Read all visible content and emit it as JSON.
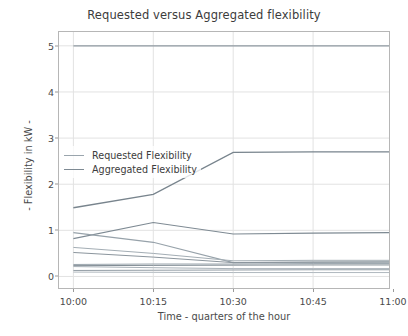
{
  "chart_data": {
    "type": "line",
    "title": "Requested versus Aggregated flexibility",
    "xlabel": "Time - quarters of the hour",
    "ylabel": "- Flexibility in kW -",
    "x": [
      "10:00",
      "10:15",
      "10:30",
      "10:45",
      "11:00"
    ],
    "x_tick_labels": [
      "10:00",
      "10:15",
      "10:30",
      "10:45",
      "11:00"
    ],
    "y_tick_labels": [
      "0",
      "1",
      "2",
      "3",
      "4",
      "5"
    ],
    "y_ticks": [
      0,
      1,
      2,
      3,
      4,
      5
    ],
    "ylim": [
      -0.25,
      5.3
    ],
    "xlim": [
      -0.18,
      3.95
    ],
    "grid": true,
    "legend_position": "center-left",
    "colors": {
      "requested": "#9aa5ad",
      "aggregated": "#7e8a93",
      "grid": "#e2e2e2",
      "axis": "#b6b6b6",
      "text": "#4a4a4a"
    },
    "legend": [
      {
        "label": "Requested Flexibility",
        "color": "#9aa5ad"
      },
      {
        "label": "Aggregated Flexibility",
        "color": "#7e8a93"
      }
    ],
    "series": [
      {
        "name": "Requested Flexibility - cap",
        "group": "requested",
        "color": "#8f9aa2",
        "width": 1.1,
        "values": [
          5.0,
          5.0,
          5.0,
          5.0,
          5.0
        ]
      },
      {
        "name": "Aggregated Flexibility - total",
        "group": "aggregated",
        "color": "#78848d",
        "width": 1.3,
        "values": [
          1.49,
          1.78,
          2.69,
          2.7,
          2.7
        ]
      },
      {
        "name": "Aggregated Flexibility - b",
        "group": "aggregated",
        "color": "#7e8a93",
        "width": 1.1,
        "values": [
          0.82,
          1.17,
          0.92,
          0.94,
          0.95
        ]
      },
      {
        "name": "Requested Flexibility - c",
        "group": "requested",
        "color": "#97a2aa",
        "width": 1.1,
        "values": [
          0.95,
          0.74,
          0.3,
          0.31,
          0.32
        ]
      },
      {
        "name": "Requested Flexibility - d",
        "group": "requested",
        "color": "#a3adb4",
        "width": 1.0,
        "values": [
          0.63,
          0.5,
          0.34,
          0.35,
          0.35
        ]
      },
      {
        "name": "Aggregated Flexibility - e",
        "group": "aggregated",
        "color": "#8b959d",
        "width": 1.0,
        "values": [
          0.52,
          0.42,
          0.3,
          0.31,
          0.31
        ]
      },
      {
        "name": "Requested Flexibility - f",
        "group": "requested",
        "color": "#9aa5ad",
        "width": 1.0,
        "values": [
          0.26,
          0.27,
          0.27,
          0.28,
          0.28
        ]
      },
      {
        "name": "Aggregated Flexibility - g",
        "group": "aggregated",
        "color": "#828d95",
        "width": 1.0,
        "values": [
          0.235,
          0.24,
          0.245,
          0.25,
          0.25
        ]
      },
      {
        "name": "Requested Flexibility - h",
        "group": "requested",
        "color": "#a8b1b8",
        "width": 1.0,
        "values": [
          0.215,
          0.19,
          0.17,
          0.17,
          0.17
        ]
      },
      {
        "name": "Aggregated Flexibility - i",
        "group": "aggregated",
        "color": "#949ea6",
        "width": 1.0,
        "values": [
          0.13,
          0.135,
          0.14,
          0.145,
          0.145
        ]
      },
      {
        "name": "Requested Flexibility - j",
        "group": "requested",
        "color": "#b0b8be",
        "width": 1.0,
        "values": [
          0.095,
          0.09,
          0.085,
          0.085,
          0.085
        ]
      }
    ]
  }
}
